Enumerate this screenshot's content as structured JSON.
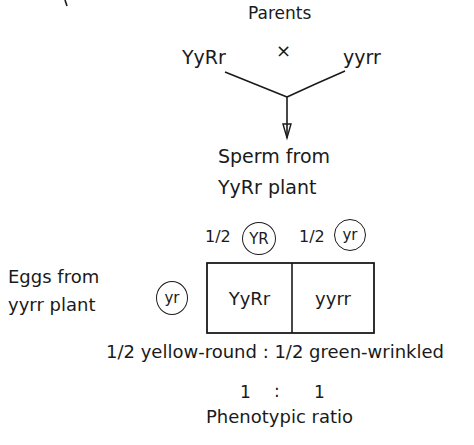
{
  "diagram": {
    "parents": {
      "label": "Parents",
      "left_genotype": "YyRr",
      "cross_symbol": "×",
      "right_genotype": "yyrr"
    },
    "sperm_label": {
      "line1": "Sperm from",
      "line2": "YyRr plant"
    },
    "sperm_gametes": [
      {
        "fraction": "1/2",
        "gamete": "YR"
      },
      {
        "fraction": "1/2",
        "gamete": "yr"
      }
    ],
    "eggs_label": {
      "line1": "Eggs from",
      "line2": "yyrr plant"
    },
    "egg_gamete": "yr",
    "punnett_cells": [
      "YyRr",
      "yyrr"
    ],
    "phenotype_line": "1/2 yellow-round : 1/2 green-wrinkled",
    "ratio": {
      "left": "1",
      "sep": ":",
      "right": "1"
    },
    "ratio_label": "Phenotypic ratio"
  }
}
